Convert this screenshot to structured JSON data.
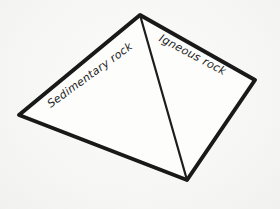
{
  "diagram": {
    "type": "labeled-solid",
    "shape": "tetrahedron",
    "labels": {
      "left_face": "Sedimentary rock",
      "right_face": "Igneous rock"
    },
    "colors": {
      "outline": "#191919",
      "internal_edge": "#1d1d1d",
      "face_fill": "#fdfdfc",
      "background": "#f6f6f5",
      "text": "#222222"
    }
  }
}
